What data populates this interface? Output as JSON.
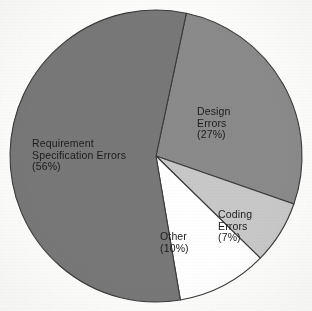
{
  "chart_data": {
    "type": "pie",
    "title": "",
    "subtitle": "",
    "xlabel": "",
    "ylabel": "",
    "legend_position": "none",
    "grid": false,
    "labels_inside_slices": true,
    "units": "percent",
    "total": 100,
    "categories": [
      "Design Errors",
      "Coding Errors",
      "Other",
      "Requirement Specification Errors"
    ],
    "values": [
      27,
      7,
      10,
      56
    ],
    "slices": [
      {
        "name": "design-errors",
        "label_lines": [
          "Design",
          "Errors",
          "(27%)"
        ],
        "label_text": "Design Errors (27%)",
        "value": 27,
        "percent_text": "(27%)",
        "color": "#8a8a8a",
        "start_angle": 12,
        "end_angle": 109.2,
        "label_x": 197,
        "label_y": 106
      },
      {
        "name": "coding-errors",
        "label_lines": [
          "Coding",
          "Errors",
          "(7%)"
        ],
        "label_text": "Coding Errors (7%)",
        "value": 7,
        "percent_text": "(7%)",
        "color": "#c8c8c8",
        "start_angle": 109.2,
        "end_angle": 134.4,
        "label_x": 218,
        "label_y": 209
      },
      {
        "name": "other",
        "label_lines": [
          "Other",
          "(10%)"
        ],
        "label_text": "Other (10%)",
        "value": 10,
        "percent_text": "(10%)",
        "color": "#ffffff",
        "start_angle": 134.4,
        "end_angle": 170.4,
        "label_x": 160,
        "label_y": 231
      },
      {
        "name": "requirement-specification-errors",
        "label_lines": [
          "Requirement",
          "Specification Errors",
          "(56%)"
        ],
        "label_text": "Requirement Specification Errors (56%)",
        "value": 56,
        "percent_text": "(56%)",
        "color": "#787878",
        "start_angle": 170.4,
        "end_angle": 372,
        "label_x": 32,
        "label_y": 138
      }
    ],
    "geometry": {
      "center_x": 156,
      "center_y": 156,
      "radius": 146
    },
    "style": {
      "background": "#fdfdfc",
      "outline_color": "#3a3a3a",
      "text_color": "#1c1c1c"
    }
  }
}
